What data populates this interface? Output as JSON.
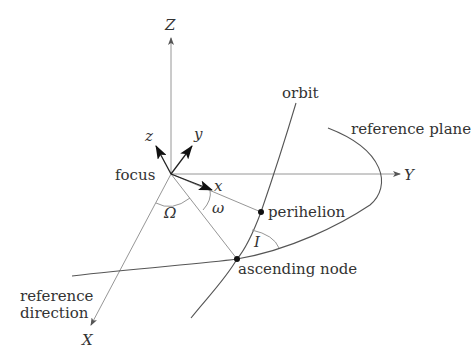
{
  "diagram": {
    "type": "orbital-elements",
    "axes": {
      "Z": "Z",
      "Y": "Y",
      "X": "X"
    },
    "body_axes": {
      "x": "x",
      "y": "y",
      "z": "z"
    },
    "labels": {
      "focus": "focus",
      "orbit": "orbit",
      "reference_plane": "reference plane",
      "perihelion": "perihelion",
      "ascending_node": "ascending node",
      "reference_direction_line1": "reference",
      "reference_direction_line2": "direction"
    },
    "angles": {
      "longitude_of_ascending_node": "Ω",
      "argument_of_periapsis": "ω",
      "inclination": "I"
    },
    "colors": {
      "axis_line": "#8a8a8a",
      "curve": "#555555",
      "vector": "#222222",
      "text": "#333333"
    }
  }
}
